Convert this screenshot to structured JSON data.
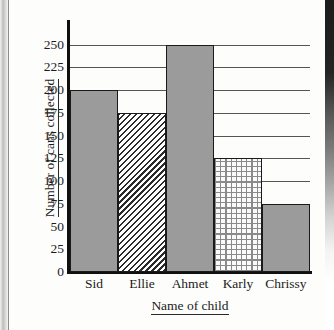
{
  "chart_data": {
    "type": "bar",
    "title": "",
    "xlabel": "Name of child",
    "ylabel": "Number of cans collected",
    "categories": [
      "Sid",
      "Ellie",
      "Ahmet",
      "Karly",
      "Chrissy"
    ],
    "values": [
      200,
      175,
      250,
      125,
      75
    ],
    "series": [
      {
        "name": "Cans collected",
        "values": [
          200,
          175,
          250,
          125,
          75
        ]
      }
    ],
    "bar_fills": [
      "solid-gray",
      "diagonal-hatch",
      "solid-gray",
      "cross-hatch-grid",
      "solid-gray"
    ],
    "ylim": [
      0,
      275
    ],
    "yticks": [
      0,
      25,
      50,
      75,
      100,
      125,
      150,
      175,
      200,
      225,
      250
    ],
    "ytick_labels": [
      "0",
      "25",
      "50",
      "75",
      "100",
      "125",
      "150",
      "175",
      "200",
      "225",
      "250"
    ],
    "grid": true,
    "grid_axis": "y",
    "legend": "none",
    "bars_adjacent": true,
    "colors": {
      "bar_solid": "#9b9b9b",
      "bar_outline": "#1a1a1a",
      "gridline": "#555555",
      "axis": "#101010",
      "text": "#1b1b1b",
      "background": "#fdfdfc"
    }
  }
}
